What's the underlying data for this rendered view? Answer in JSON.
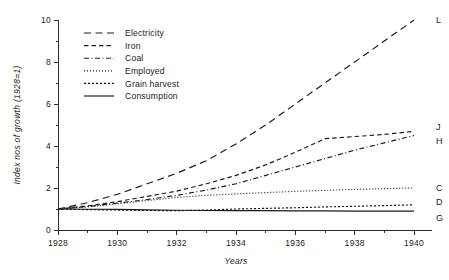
{
  "chart_data": {
    "type": "line",
    "title": "",
    "xlabel": "Years",
    "ylabel": "Index nos of growth (1928=1)",
    "xlim": [
      1928,
      1940
    ],
    "ylim": [
      0,
      10
    ],
    "grid": false,
    "legend_position": "top-left inside plot",
    "x_ticks_major": [
      1928,
      1930,
      1932,
      1934,
      1936,
      1938,
      1940
    ],
    "x_ticks_minor": [
      1929,
      1931,
      1933,
      1935,
      1937,
      1939
    ],
    "y_ticks_major": [
      0,
      2,
      4,
      6,
      8,
      10
    ],
    "y_ticks_minor": [
      1,
      3,
      5,
      7,
      9
    ],
    "x": [
      1928,
      1929,
      1930,
      1931,
      1932,
      1933,
      1934,
      1935,
      1936,
      1937,
      1938,
      1939,
      1940
    ],
    "series": [
      {
        "name": "Electricity",
        "end_label": "L",
        "dash": "long-dash",
        "values": [
          1.0,
          1.3,
          1.7,
          2.2,
          2.7,
          3.3,
          4.1,
          5.0,
          6.0,
          7.0,
          8.0,
          9.0,
          10.0
        ]
      },
      {
        "name": "Iron",
        "end_label": "J",
        "dash": "medium-dash",
        "values": [
          1.0,
          1.15,
          1.35,
          1.6,
          1.85,
          2.2,
          2.6,
          3.1,
          3.7,
          4.35,
          4.45,
          4.55,
          4.7
        ]
      },
      {
        "name": "Coal",
        "end_label": "H",
        "dash": "dash-dot",
        "values": [
          1.0,
          1.12,
          1.28,
          1.45,
          1.65,
          1.9,
          2.2,
          2.6,
          3.0,
          3.4,
          3.8,
          4.15,
          4.5
        ]
      },
      {
        "name": "Employed",
        "end_label": "C",
        "dash": "dotted",
        "values": [
          1.0,
          1.1,
          1.25,
          1.4,
          1.55,
          1.65,
          1.72,
          1.78,
          1.84,
          1.89,
          1.93,
          1.97,
          2.0
        ]
      },
      {
        "name": "Grain harvest",
        "end_label": "D",
        "dash": "short-dash",
        "values": [
          1.0,
          0.97,
          0.95,
          0.93,
          0.92,
          0.95,
          1.0,
          1.03,
          1.06,
          1.1,
          1.13,
          1.16,
          1.2
        ]
      },
      {
        "name": "Consumption",
        "end_label": "G",
        "dash": "solid",
        "values": [
          1.0,
          0.99,
          0.98,
          0.96,
          0.94,
          0.93,
          0.92,
          0.92,
          0.91,
          0.91,
          0.9,
          0.9,
          0.9
        ]
      }
    ]
  },
  "legend": {
    "items": [
      {
        "label": "Electricity"
      },
      {
        "label": "Iron"
      },
      {
        "label": "Coal"
      },
      {
        "label": "Employed"
      },
      {
        "label": "Grain harvest"
      },
      {
        "label": "Consumption"
      }
    ]
  },
  "axes": {
    "y_title": "Index nos of growth (1928=1)",
    "x_title": "Years"
  },
  "colors": {
    "ink": "#1a1a1a",
    "axis": "#2b2b2b",
    "background": "#ffffff"
  }
}
